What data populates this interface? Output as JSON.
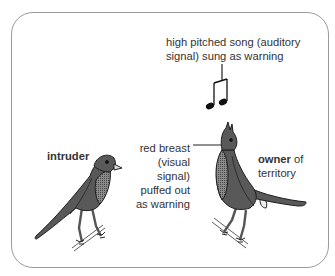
{
  "diagram": {
    "labels": {
      "song_line1": "high pitched song (auditory",
      "song_line2": "signal) sung as warning",
      "intruder": "intruder",
      "breast_line1": "red breast",
      "breast_line2": "(visual signal)",
      "breast_line3": "puffed out",
      "breast_line4": "as warning",
      "owner_bold": "owner",
      "owner_rest": " of",
      "owner_line2": "territory"
    },
    "icons": {
      "music_note": "beamed-eighth-notes",
      "intruder_bird": "robin-facing-right",
      "owner_bird": "robin-singing-beak-up"
    },
    "colors": {
      "border": "#9a9a9a",
      "bird_fill": "#5a5a5a",
      "breast_fill": "#7a7a7a",
      "outline": "#1e1e1e",
      "text": "#333333"
    }
  }
}
